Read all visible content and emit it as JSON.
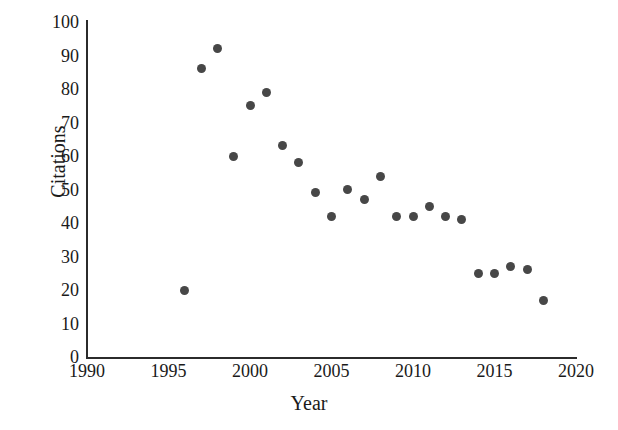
{
  "chart_data": {
    "type": "scatter",
    "title": "",
    "xlabel": "Year",
    "ylabel": "Citations",
    "xlim": [
      1990,
      2020
    ],
    "ylim": [
      0,
      100
    ],
    "xticks": [
      1990,
      1995,
      2000,
      2005,
      2010,
      2015,
      2020
    ],
    "yticks": [
      0,
      10,
      20,
      30,
      40,
      50,
      60,
      70,
      80,
      90,
      100
    ],
    "xtick_labels": [
      "1990",
      "1995",
      "2000",
      "2005",
      "2010",
      "2015",
      "2020"
    ],
    "ytick_labels": [
      "0",
      "10",
      "20",
      "30",
      "40",
      "50",
      "60",
      "70",
      "80",
      "90",
      "100"
    ],
    "grid": false,
    "legend": false,
    "marker_color": "#474747",
    "axis_color": "#2b2b2b",
    "background_color": "#ffffff",
    "series": [
      {
        "name": "Citations",
        "points": [
          {
            "x": 1996,
            "y": 20
          },
          {
            "x": 1997,
            "y": 86
          },
          {
            "x": 1998,
            "y": 92
          },
          {
            "x": 1999,
            "y": 60
          },
          {
            "x": 2000,
            "y": 75
          },
          {
            "x": 2001,
            "y": 79
          },
          {
            "x": 2002,
            "y": 63
          },
          {
            "x": 2003,
            "y": 58
          },
          {
            "x": 2004,
            "y": 49
          },
          {
            "x": 2005,
            "y": 42
          },
          {
            "x": 2006,
            "y": 50
          },
          {
            "x": 2007,
            "y": 47
          },
          {
            "x": 2008,
            "y": 54
          },
          {
            "x": 2009,
            "y": 42
          },
          {
            "x": 2010,
            "y": 42
          },
          {
            "x": 2011,
            "y": 45
          },
          {
            "x": 2012,
            "y": 42
          },
          {
            "x": 2013,
            "y": 41
          },
          {
            "x": 2014,
            "y": 25
          },
          {
            "x": 2015,
            "y": 25
          },
          {
            "x": 2016,
            "y": 27
          },
          {
            "x": 2017,
            "y": 26
          },
          {
            "x": 2018,
            "y": 17
          }
        ]
      }
    ]
  }
}
